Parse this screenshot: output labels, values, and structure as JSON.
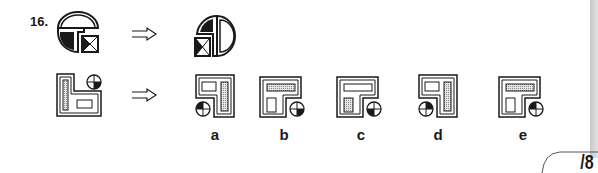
{
  "question": {
    "number": "16.",
    "type": "figure-analogy",
    "example_pair": {
      "source_figure": "semicircle-top-with-black-quarter-and-hourglass-square",
      "target_figure": "rotated-semicircle-right-with-black-quarter-and-hourglass-square"
    },
    "test_figure": "L-frame-with-dotted-bar-left-crosshair-circle-topright-small-rect-bottom"
  },
  "arrow_icon": "double-arrow-right",
  "options": [
    {
      "label": "a"
    },
    {
      "label": "b"
    },
    {
      "label": "c"
    },
    {
      "label": "d"
    },
    {
      "label": "e"
    }
  ],
  "score": {
    "text": "/8"
  },
  "colors": {
    "ink": "#1a1a1a",
    "stipple": "#9a9a9a",
    "paper": "#ffffff"
  }
}
